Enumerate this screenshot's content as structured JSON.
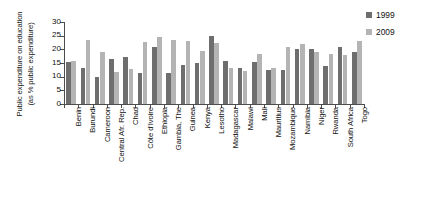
{
  "chart_data": {
    "type": "bar",
    "title": "",
    "subtitle": "",
    "xlabel": "",
    "ylabel": "Public expenditure on education (as % public expenditure)",
    "ylabel_lines": [
      "Public expenditure on education",
      "(as % public expenditure)"
    ],
    "ylim": [
      0,
      30
    ],
    "ytick_values": [
      0,
      5,
      10,
      15,
      20,
      25,
      30
    ],
    "ytick_labels": [
      "0",
      "5",
      "10",
      "15",
      "20",
      "25",
      "30"
    ],
    "grid": false,
    "legend_position": "top-right",
    "categories": [
      "Benin",
      "Burundi",
      "Cameroon",
      "Central Afr. Rep.",
      "Chad",
      "Côte d'Ivoire",
      "Ethiopia",
      "Gambia, The",
      "Guinea",
      "Kenya",
      "Lesotho",
      "Madagascar",
      "Malawi",
      "Mali",
      "Mauritius",
      "Mozambique",
      "Namibia",
      "Niger",
      "Rwanda",
      "South Africa",
      "Togo"
    ],
    "series": [
      {
        "name": "1999",
        "color": "#6e6e6e",
        "values": [
          15.3,
          13.0,
          9.8,
          16.4,
          17.2,
          11.4,
          21.0,
          11.5,
          14.4,
          15.0,
          24.9,
          15.6,
          13.0,
          15.5,
          12.6,
          12.4,
          20.0,
          20.2,
          14.0,
          20.8,
          19.0
        ]
      },
      {
        "name": "2009",
        "color": "#b4b4b4",
        "values": [
          15.7,
          23.4,
          19.2,
          11.8,
          12.7,
          22.6,
          24.7,
          23.4,
          23.1,
          19.5,
          22.3,
          13.2,
          12.1,
          18.4,
          13.1,
          21.0,
          21.8,
          19.0,
          18.4,
          17.9,
          23.0
        ]
      }
    ]
  },
  "legend": {
    "entries": [
      {
        "label": "1999",
        "color": "#6e6e6e"
      },
      {
        "label": "2009",
        "color": "#b4b4b4"
      }
    ]
  }
}
